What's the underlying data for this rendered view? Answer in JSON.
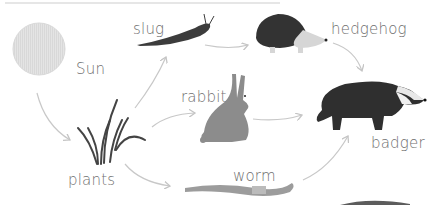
{
  "diagram": {
    "type": "food-web",
    "nodes": [
      {
        "id": "sun",
        "label": "Sun"
      },
      {
        "id": "plants",
        "label": "plants"
      },
      {
        "id": "slug",
        "label": "slug"
      },
      {
        "id": "rabbit",
        "label": "rabbit"
      },
      {
        "id": "worm",
        "label": "worm"
      },
      {
        "id": "hedgehog",
        "label": "hedgehog"
      },
      {
        "id": "badger",
        "label": "badger"
      }
    ],
    "edges": [
      {
        "from": "sun",
        "to": "plants"
      },
      {
        "from": "plants",
        "to": "slug"
      },
      {
        "from": "plants",
        "to": "rabbit"
      },
      {
        "from": "plants",
        "to": "worm"
      },
      {
        "from": "slug",
        "to": "hedgehog"
      },
      {
        "from": "hedgehog",
        "to": "badger"
      },
      {
        "from": "rabbit",
        "to": "badger"
      },
      {
        "from": "worm",
        "to": "badger"
      }
    ]
  },
  "colors": {
    "arrow": "#c8c8c8",
    "label": "#6f6f6f",
    "sun": "#e3e3e3",
    "dark_animal": "#3a3a3a",
    "rabbit": "#8a8a8a",
    "worm": "#9a9a9a"
  }
}
